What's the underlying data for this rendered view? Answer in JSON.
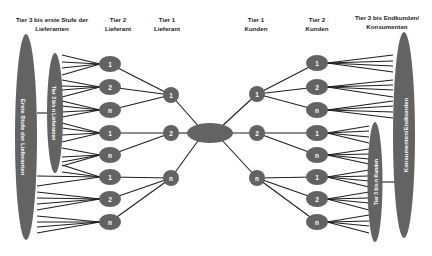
{
  "headers": {
    "tier3_suppliers": [
      "Tier 3 bis erste Stufe der",
      "Lieferanten"
    ],
    "tier2_supplier": [
      "Tier 2",
      "Lieferant"
    ],
    "tier1_supplier": [
      "Tier 1",
      "Lieferant"
    ],
    "tier1_customers": [
      "Tier 1",
      "Kunden"
    ],
    "tier2_customers": [
      "Tier 2",
      "Kunden"
    ],
    "tier3_customers": [
      "Tier 3 bis Endkunden/",
      "Konsumenten"
    ]
  },
  "groups": {
    "first_tier_suppliers": "Erste Stufe der Lieferanten",
    "tier3_to_n_suppliers": "Tier 3 bis n Lieferanten",
    "tier3_to_n_customers": "Tier 3 bis n Kunden",
    "consumers_endcustomers": "Konsumenten/Endkunden"
  },
  "nodes": {
    "tier2_suppliers": [
      "1",
      "2",
      "n",
      "1",
      "n",
      "1",
      "2",
      "n"
    ],
    "tier1_suppliers": [
      "1",
      "2",
      "n"
    ],
    "focal_company": "",
    "tier1_customers": [
      "1",
      "2",
      "n"
    ],
    "tier2_customers": [
      "1",
      "2",
      "n",
      "1",
      "n",
      "1",
      "2",
      "n"
    ]
  },
  "colors": {
    "node": "#636363",
    "edge": "#1e1e1e",
    "text": "#222222",
    "background": "#ffffff"
  }
}
